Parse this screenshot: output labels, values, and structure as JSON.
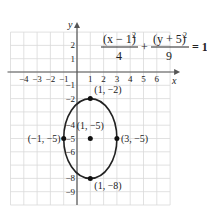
{
  "equation": {
    "term1_num": "(x − 1)",
    "term1_exp": "2",
    "term1_den": "4",
    "plus": "+",
    "term2_num": "(y + 5)",
    "term2_exp": "2",
    "term2_den": "9",
    "rhs": "= 1"
  },
  "axes": {
    "x_label": "x",
    "y_label": "y",
    "x_range": [
      -5,
      7
    ],
    "y_range": [
      -10,
      3
    ],
    "x_ticks": [
      -4,
      -3,
      -2,
      -1,
      1,
      2,
      3,
      4,
      5,
      6
    ],
    "y_ticks": [
      2,
      1,
      -1,
      -2,
      -4,
      -5,
      -6,
      -8,
      -9
    ]
  },
  "ellipse": {
    "center": [
      1,
      -5
    ],
    "a_horizontal": 2,
    "b_vertical": 3
  },
  "points": [
    {
      "x": 1,
      "y": -2,
      "label": "(1, −2)"
    },
    {
      "x": 1,
      "y": -5,
      "label": "(1, −5)"
    },
    {
      "x": -1,
      "y": -5,
      "label": "(−1, −5)"
    },
    {
      "x": 3,
      "y": -5,
      "label": "(3, −5)"
    },
    {
      "x": 1,
      "y": -8,
      "label": "(1, −8)"
    }
  ],
  "colors": {
    "grid": "#d9d9d9",
    "axis": "#555555",
    "curve": "#222222",
    "point": "#111111"
  }
}
